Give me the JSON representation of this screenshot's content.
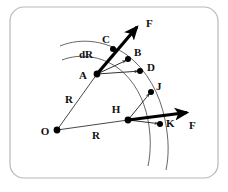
{
  "figure": {
    "kind": "vector-physics-diagram",
    "background_color": "#ffffff",
    "border": {
      "color": "#b8b8b8",
      "radius": 14,
      "x": 10,
      "y": 7,
      "width": 208,
      "height": 171
    },
    "stroke_colors": {
      "thick_vector": "#000000",
      "thin_line": "#333333",
      "arc": "#555555"
    },
    "points": [
      {
        "id": "O",
        "label": "O",
        "x": 57,
        "y": 130,
        "label_x": 45,
        "label_y": 135,
        "dot_r": 3.4
      },
      {
        "id": "A",
        "label": "A",
        "x": 97,
        "y": 74,
        "label_x": 83,
        "label_y": 79,
        "dot_r": 3.4
      },
      {
        "id": "C",
        "label": "C",
        "x": 113,
        "y": 49,
        "label_x": 106,
        "label_y": 43,
        "dot_r": 3.0
      },
      {
        "id": "B",
        "label": "B",
        "x": 128,
        "y": 59,
        "label_x": 134,
        "label_y": 56,
        "dot_r": 3.0
      },
      {
        "id": "D",
        "label": "D",
        "x": 140,
        "y": 71,
        "label_x": 147,
        "label_y": 71,
        "dot_r": 3.0
      },
      {
        "id": "H",
        "label": "H",
        "x": 128,
        "y": 120,
        "label_x": 116,
        "label_y": 113,
        "dot_r": 3.4
      },
      {
        "id": "J",
        "label": "J",
        "x": 151,
        "y": 92,
        "label_x": 156,
        "label_y": 90,
        "dot_r": 3.0
      },
      {
        "id": "K",
        "label": "K",
        "x": 160,
        "y": 124,
        "label_x": 166,
        "label_y": 125,
        "dot_r": 3.0
      }
    ],
    "vectors": [
      {
        "id": "force-vector-upper",
        "name": "F-upper",
        "from_x": 97,
        "from_y": 74,
        "to_x": 139,
        "to_y": 25,
        "style": "thick",
        "label": "F",
        "label_x": 146,
        "label_y": 24
      },
      {
        "id": "force-vector-lower",
        "name": "F-lower",
        "from_x": 128,
        "from_y": 120,
        "to_x": 190,
        "to_y": 112,
        "style": "thick",
        "label": "F",
        "label_x": 190,
        "label_y": 127
      },
      {
        "id": "vector-A-to-B",
        "name": "A-B",
        "from_x": 97,
        "from_y": 74,
        "to_x": 127,
        "to_y": 60,
        "style": "thin"
      },
      {
        "id": "vector-A-to-D",
        "name": "A-D",
        "from_x": 97,
        "from_y": 74,
        "to_x": 139,
        "to_y": 71,
        "style": "thin"
      },
      {
        "id": "vector-H-to-J",
        "name": "H-J",
        "from_x": 128,
        "from_y": 120,
        "to_x": 150,
        "to_y": 93,
        "style": "thin"
      },
      {
        "id": "vector-H-to-K",
        "name": "H-K",
        "from_x": 128,
        "from_y": 120,
        "to_x": 159,
        "to_y": 124,
        "style": "thin"
      }
    ],
    "segments": [
      {
        "id": "radius-O-A",
        "name": "radius-OA",
        "from_x": 57,
        "from_y": 130,
        "to_x": 97,
        "to_y": 74
      },
      {
        "id": "radius-O-H",
        "name": "radius-OH",
        "from_x": 57,
        "from_y": 130,
        "to_x": 128,
        "to_y": 120
      }
    ],
    "arcs": [
      {
        "id": "arc-inner",
        "name": "inner-radius-arc",
        "path": "M 62 60 C 80 53 101 56 118 68 C 134 80 144 99 148 120 C 151 136 151 152 148 166"
      },
      {
        "id": "arc-outer",
        "name": "outer-radius-arc",
        "path": "M 60 46 C 82 37 107 41 127 55 C 147 70 160 94 165 120 C 169 139 169 156 166 170"
      }
    ],
    "dimension_labels": [
      {
        "id": "label-dR",
        "name": "dR-label",
        "text": "dR",
        "x": 86,
        "y": 58
      },
      {
        "id": "label-R-left",
        "name": "R-label-OA",
        "text": "R",
        "x": 69,
        "y": 103
      },
      {
        "id": "label-R-bottom",
        "name": "R-label-OH",
        "text": "R",
        "x": 96,
        "y": 138
      }
    ]
  }
}
